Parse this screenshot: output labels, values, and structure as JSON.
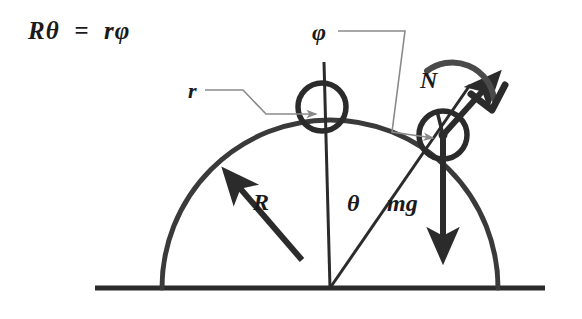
{
  "figure": {
    "background_color": "#ffffff",
    "ink_color": "#2b2b2b",
    "leader_color": "#7d7d7d"
  },
  "equation": {
    "text": "Rθ  =  rφ",
    "meaning": "rolling-constraint"
  },
  "labels": {
    "phi": "φ",
    "r": "r",
    "N": "N",
    "R": "R",
    "theta": "θ",
    "mg": "mg"
  },
  "geometry": {
    "ground": {
      "x1": 95,
      "y1": 288,
      "x2": 545,
      "y2": 288,
      "stroke_width": 5
    },
    "dome": {
      "cx": 330,
      "cy": 288,
      "radius": 168,
      "stroke_width": 5,
      "description": "hemisphere of radius R"
    },
    "top_circle": {
      "cx": 322,
      "cy": 107,
      "radius": 24,
      "stroke_width": 5,
      "description": "cylinder of radius r at apex"
    },
    "rolling_circle": {
      "cx": 443,
      "cy": 135,
      "radius": 24,
      "stroke_width": 5,
      "description": "cylinder of radius r displaced by angle theta"
    },
    "vertical_line": {
      "x": 324,
      "y_top": 62,
      "y_bottom": 288,
      "stroke_width": 3
    },
    "radial_line": {
      "x1": 330,
      "y1": 288,
      "x2": 470,
      "y2": 85,
      "stroke_width": 3,
      "description": "line from dome center through rolling cylinder center"
    },
    "R_arrow": {
      "x1": 300,
      "y1": 258,
      "x2": 222,
      "y2": 168,
      "description": "radius arrow pointing from center to dome surface"
    },
    "N_arrow": {
      "x1": 443,
      "y1": 135,
      "x2": 500,
      "y2": 72,
      "description": "normal force arrow, outward radial"
    },
    "mg_arrow": {
      "x1": 443,
      "y1": 135,
      "x2": 443,
      "y2": 265,
      "description": "weight arrow pointing straight down"
    },
    "rotation_arrow": {
      "from_x": 428,
      "from_y": 68,
      "to_x": 498,
      "to_y": 105,
      "direction": "clockwise",
      "description": "curved arrow showing spin sense of rolling cylinder"
    },
    "phi_leader": {
      "points": "338,31 405,31 392,132 437,138",
      "description": "thin leader from phi label to rolling cylinder center"
    },
    "r_leader": {
      "points": "205,90 243,90 266,114 322,114",
      "description": "thin leader from r label to top cylinder center"
    }
  }
}
